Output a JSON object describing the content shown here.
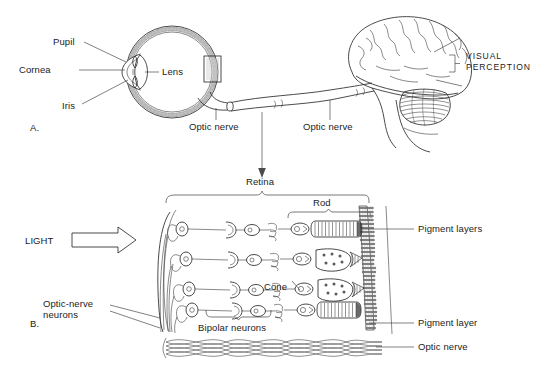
{
  "figure": {
    "background_color": "#ffffff",
    "ink_color": "#2a2a2a",
    "text_color": "#1b1b1b"
  },
  "panel_a": {
    "letter": "A.",
    "labels": {
      "pupil": "Pupil",
      "cornea": "Cornea",
      "iris": "Iris",
      "lens": "Lens",
      "optic_nerve_eye": "Optic nerve",
      "optic_nerve_brain": "Optic nerve",
      "visual_perception_line1": "VISUAL",
      "visual_perception_line2": "PERCEPTION"
    }
  },
  "panel_b": {
    "letter": "B.",
    "labels": {
      "light": "LIGHT",
      "retina": "Retina",
      "rod": "Rod",
      "cone": "Cone",
      "bipolar_neurons": "Bipolar neurons",
      "optic_nerve_neurons_line1": "Optic-nerve",
      "optic_nerve_neurons_line2": "neurons",
      "pigment_layers": "Pigment layers",
      "pigment_layer": "Pigment layer",
      "optic_nerve": "Optic nerve"
    }
  }
}
